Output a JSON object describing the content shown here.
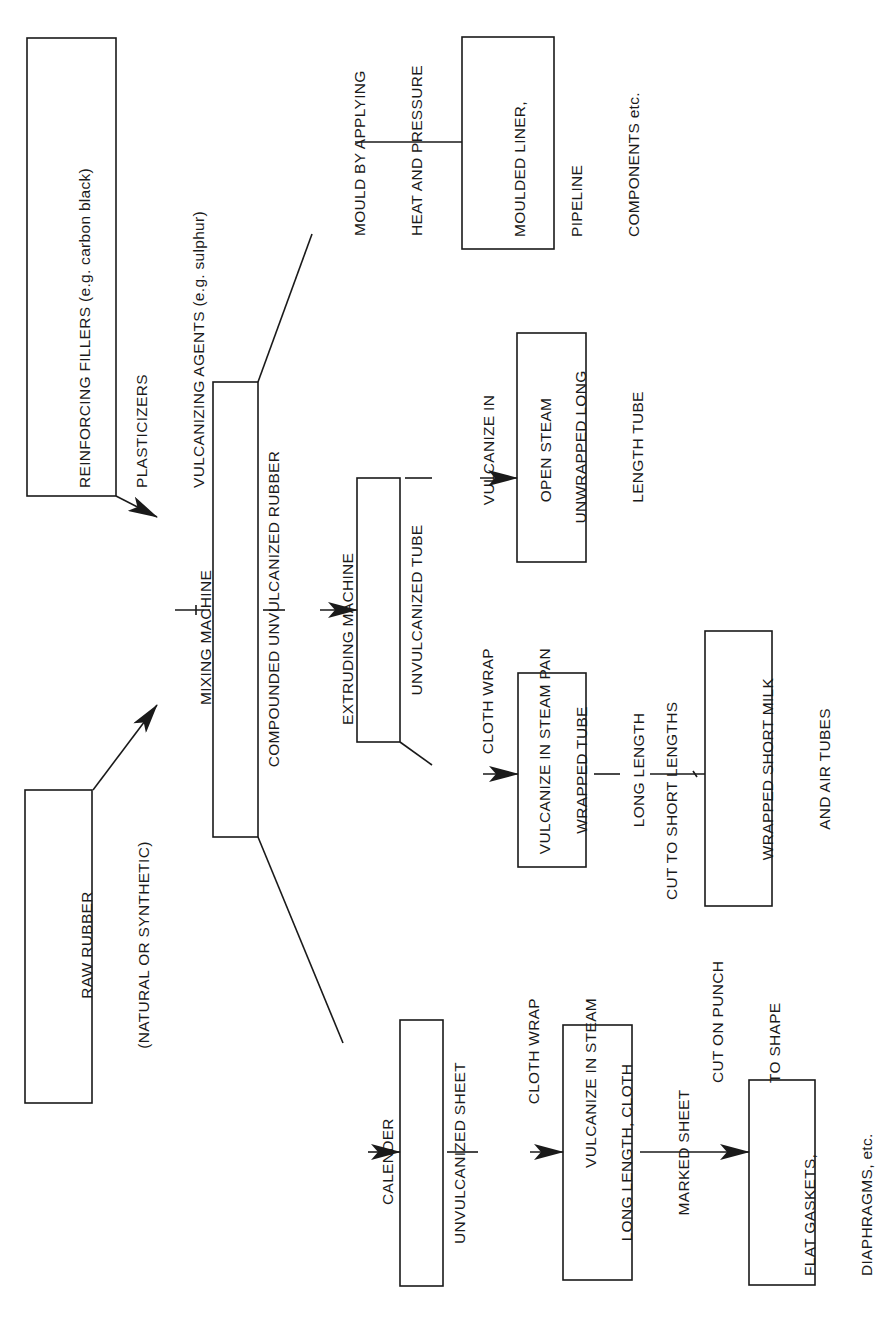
{
  "diagram": {
    "colors": {
      "ink": "#1a1a1a",
      "background": "#ffffff"
    },
    "boxes": {
      "reinforcing": {
        "lines": [
          "REINFORCING FILLERS (e.g. carbon black)",
          "PLASTICIZERS",
          "VULCANIZING AGENTS (e.g. sulphur)"
        ]
      },
      "raw_rubber": {
        "lines": [
          "RAW RUBBER",
          "(NATURAL OR SYNTHETIC)"
        ]
      },
      "compounded": {
        "lines": [
          "COMPOUNDED UNVULCANIZED RUBBER"
        ]
      },
      "unvulcanized_tube": {
        "lines": [
          "UNVULCANIZED TUBE"
        ]
      },
      "moulded_liner": {
        "lines": [
          "MOULDED LINER,",
          "PIPELINE",
          "COMPONENTS etc."
        ]
      },
      "unwrapped_long": {
        "lines": [
          "UNWRAPPED LONG",
          "LENGTH TUBE"
        ]
      },
      "wrapped_tube": {
        "lines": [
          "WRAPPED TUBE",
          "LONG LENGTH"
        ]
      },
      "wrapped_short": {
        "lines": [
          "WRAPPED SHORT MILK",
          "AND AIR TUBES"
        ]
      },
      "unvulcanized_sheet": {
        "lines": [
          "UNVULCANIZED SHEET"
        ]
      },
      "long_length_sheet": {
        "lines": [
          "LONG LENGTH, CLOTH",
          "MARKED SHEET"
        ]
      },
      "flat_gaskets": {
        "lines": [
          "FLAT GASKETS,",
          "DIAPHRAGMS, etc."
        ]
      }
    },
    "process_labels": {
      "mixing_machine": [
        "MIXING MACHINE"
      ],
      "mould": [
        "MOULD BY APPLYING",
        "HEAT AND PRESSURE"
      ],
      "extruding_machine": [
        "EXTRUDING MACHINE"
      ],
      "vulcanize_open_steam": [
        "VULCANIZE IN",
        "OPEN STEAM"
      ],
      "cloth_wrap_steam_pan": [
        "CLOTH WRAP",
        "VULCANIZE IN STEAM PAN"
      ],
      "cut_short_lengths": [
        "CUT TO SHORT LENGTHS"
      ],
      "calender": [
        "CALENDER"
      ],
      "cloth_wrap_steam": [
        "CLOTH WRAP",
        "VULCANIZE IN STEAM"
      ],
      "cut_on_punch": [
        "CUT ON PUNCH",
        "TO SHAPE"
      ]
    }
  }
}
